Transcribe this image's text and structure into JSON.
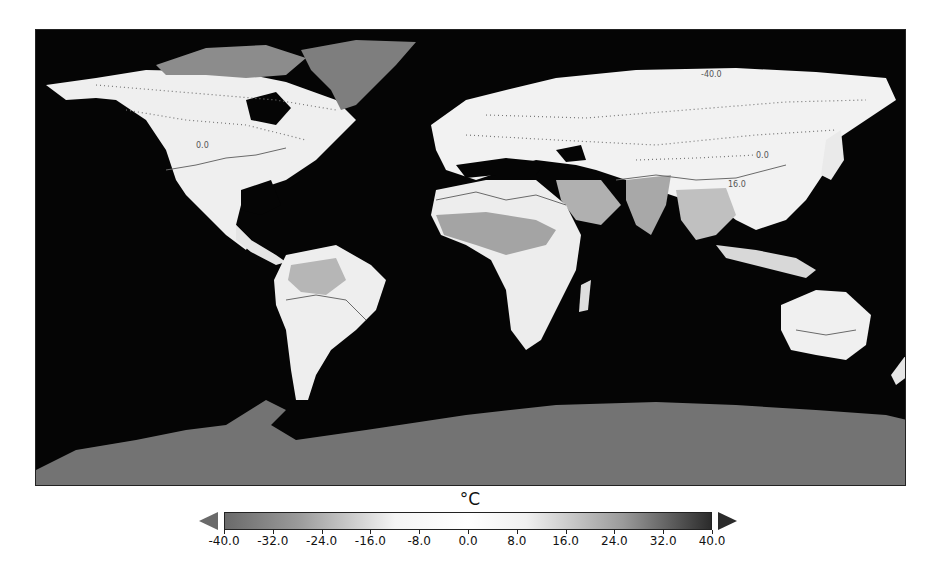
{
  "figure": {
    "type": "global surface temperature map (grayscale)",
    "background_ocean_color": "#050505"
  },
  "map": {
    "contour_labels": [
      {
        "text": "-40.0",
        "x": 700,
        "y": 76
      },
      {
        "text": "0.0",
        "x": 196,
        "y": 147
      },
      {
        "text": "0.0",
        "x": 757,
        "y": 158
      },
      {
        "text": "16.0",
        "x": 728,
        "y": 186
      },
      {
        "text": "16.0",
        "x": 734,
        "y": 196
      }
    ]
  },
  "colorbar": {
    "title": "°C",
    "min": -40.0,
    "max": 40.0,
    "extend": "both",
    "ticks": [
      "-40.0",
      "-32.0",
      "-24.0",
      "-16.0",
      "-8.0",
      "0.0",
      "8.0",
      "16.0",
      "24.0",
      "32.0",
      "40.0"
    ],
    "colors": {
      "low_end": "#6a6a6a",
      "mid": "#ffffff",
      "high_end": "#2b2b2b"
    }
  },
  "chart_data": {
    "type": "heatmap",
    "title": "",
    "colorbar_label": "°C",
    "value_range": [
      -40.0,
      40.0
    ],
    "colorbar_ticks": [
      -40.0,
      -32.0,
      -24.0,
      -16.0,
      -8.0,
      0.0,
      8.0,
      16.0,
      24.0,
      32.0,
      40.0
    ],
    "contour_levels_labeled": [
      -40.0,
      0.0,
      16.0
    ],
    "projection": "equirectangular world map",
    "regions_shading": {
      "Antarctica": "cold (about -40 to -30)",
      "Greenland": "cold (about -32 to -24)",
      "Arctic Canada": "cold (about -24 to -16)",
      "North America / Eurasia": "near 0 (white)",
      "Sahara / Sahel": "warm (about 24 to 32)",
      "Arabia / India": "warm (about 24 to 32)",
      "Amazon": "warm (about 24)",
      "Australia": "mild to warm (about 16 to 24)"
    }
  }
}
